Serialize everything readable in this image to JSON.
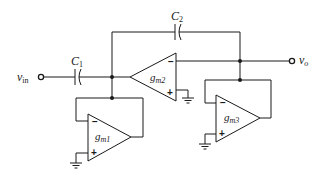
{
  "diagram": {
    "type": "circuit-schematic",
    "input_terminal": {
      "label": "v",
      "sub": "in"
    },
    "output_terminal": {
      "label": "v",
      "sub": "o"
    },
    "capacitors": [
      {
        "id": "C1",
        "label": "C",
        "sub": "1"
      },
      {
        "id": "C2",
        "label": "C",
        "sub": "2"
      }
    ],
    "transconductors": [
      {
        "id": "gm1",
        "label": "g",
        "sub": "m1",
        "minus": "−",
        "plus": "+"
      },
      {
        "id": "gm2",
        "label": "g",
        "sub": "m2",
        "minus": "−",
        "plus": "+"
      },
      {
        "id": "gm3",
        "label": "g",
        "sub": "m3",
        "minus": "−",
        "plus": "+"
      }
    ],
    "colors": {
      "line": "#1a1a1a",
      "background": "#ffffff"
    }
  }
}
